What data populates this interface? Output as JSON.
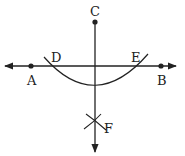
{
  "diagram": {
    "points": {
      "A": {
        "label": "A",
        "x": 31,
        "y": 66
      },
      "B": {
        "label": "B",
        "x": 161,
        "y": 66
      },
      "C": {
        "label": "C",
        "x": 95,
        "y": 22
      },
      "D": {
        "label": "D",
        "x": 47,
        "y": 66
      },
      "E": {
        "label": "E",
        "x": 143,
        "y": 66
      },
      "F": {
        "label": "F",
        "x": 95,
        "y": 123
      }
    },
    "labels": {
      "A": "A",
      "B": "B",
      "C": "C",
      "D": "D",
      "E": "E",
      "F": "F"
    },
    "line_color": "#222222"
  }
}
